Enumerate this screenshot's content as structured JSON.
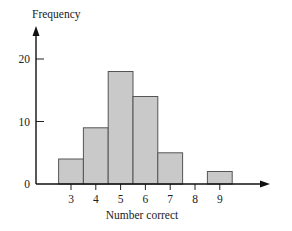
{
  "chart_data": {
    "type": "bar",
    "subtype": "histogram",
    "title": "",
    "xlabel": "Number correct",
    "ylabel": "Frequency",
    "categories": [
      "3",
      "4",
      "5",
      "6",
      "7",
      "8",
      "9"
    ],
    "values": [
      4,
      9,
      18,
      14,
      5,
      0,
      2
    ],
    "x_ticks": [
      "3",
      "4",
      "5",
      "6",
      "7",
      "8",
      "9"
    ],
    "y_ticks": [
      "0",
      "10",
      "20"
    ],
    "ylim": [
      0,
      25
    ],
    "grid": false,
    "legend": null,
    "colors": {
      "bar_fill": "#c9c9c9",
      "bar_stroke": "#555555",
      "axis": "#111111"
    }
  }
}
